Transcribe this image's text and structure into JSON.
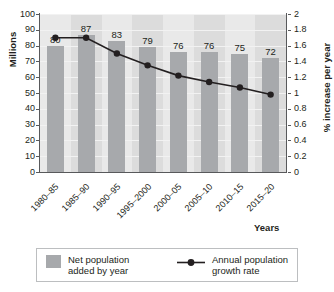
{
  "chart_data": {
    "type": "bar",
    "title": "",
    "categories": [
      "1980–85",
      "1985–90",
      "1990–95",
      "1995–2000",
      "2000–05",
      "2005–10",
      "2010–15",
      "2015–20"
    ],
    "xlabel": "Years",
    "grid": true,
    "legend_position": "bottom",
    "series": [
      {
        "name": "Net population added by year",
        "type": "bar",
        "axis": "left",
        "ylabel": "Millions",
        "ylim": [
          0,
          100
        ],
        "yticks": [
          "0",
          "10",
          "20",
          "30",
          "40",
          "50",
          "60",
          "70",
          "80",
          "90",
          "100"
        ],
        "values": [
          80,
          87,
          83,
          79,
          76,
          76,
          75,
          72
        ],
        "data_labels": [
          "80",
          "87",
          "83",
          "79",
          "76",
          "76",
          "75",
          "72"
        ],
        "color": "#a7a9ac"
      },
      {
        "name": "Annual population growth rate",
        "type": "line",
        "axis": "right",
        "ylabel": "% increase per year",
        "ylim": [
          0,
          2
        ],
        "yticks": [
          "0",
          "0.2",
          "0.4",
          "0.6",
          "0.8",
          "1",
          "1.2",
          "1.4",
          "1.6",
          "1.8",
          "2"
        ],
        "values": [
          1.7,
          1.7,
          1.5,
          1.35,
          1.22,
          1.14,
          1.07,
          0.98
        ],
        "color": "#231f20"
      }
    ]
  },
  "legend": {
    "bars_label_line1": "Net population",
    "bars_label_line2": "added by year",
    "line_label_line1": "Annual population",
    "line_label_line2": "growth rate"
  },
  "caption": ""
}
